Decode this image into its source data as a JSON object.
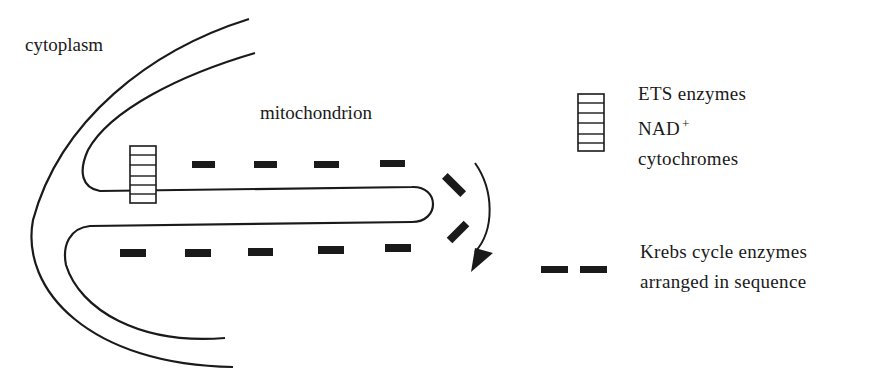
{
  "diagram": {
    "labels": {
      "cytoplasm": "cytoplasm",
      "mitochondrion": "mitochondrion"
    },
    "legend": {
      "ets": {
        "icon": "striped-box-icon",
        "line1": "ETS enzymes",
        "line2_base": "NAD",
        "line2_sup": "+",
        "line3": "cytochromes"
      },
      "krebs": {
        "icon": "dash-pair-icon",
        "line1": "Krebs cycle enzymes",
        "line2": "arranged in sequence"
      }
    },
    "colors": {
      "ink": "#1a1a1a",
      "background": "#ffffff"
    }
  }
}
